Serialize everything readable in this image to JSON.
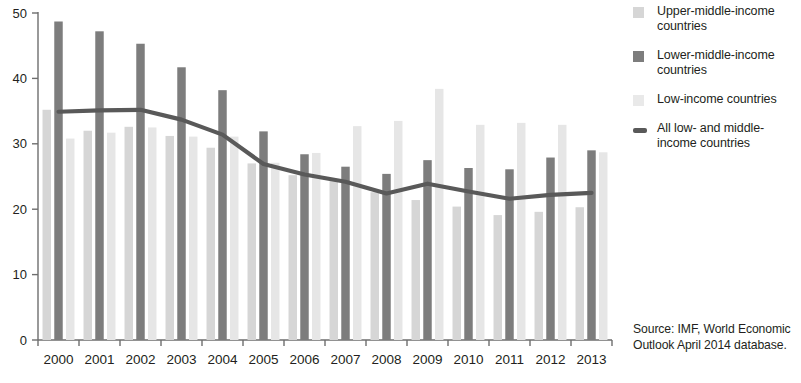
{
  "chart_data": {
    "type": "bar",
    "title": "",
    "subtitle": "",
    "xlabel": "",
    "ylabel": "",
    "ylim": [
      0,
      50
    ],
    "yticks": [
      0,
      10,
      20,
      30,
      40,
      50
    ],
    "grid": false,
    "legend_position": "right",
    "categories": [
      "2000",
      "2001",
      "2002",
      "2003",
      "2004",
      "2005",
      "2006",
      "2007",
      "2008",
      "2009",
      "2010",
      "2011",
      "2012",
      "2013"
    ],
    "series": [
      {
        "name": "Upper-middle-income countries",
        "type": "bar",
        "color": "#d6d6d6",
        "values": [
          35.2,
          32.0,
          32.6,
          31.2,
          29.4,
          27.0,
          25.2,
          24.3,
          22.6,
          21.4,
          20.4,
          19.1,
          19.6,
          20.3
        ]
      },
      {
        "name": "Lower-middle-income countries",
        "type": "bar",
        "color": "#7d7d7d",
        "values": [
          48.7,
          47.2,
          45.3,
          41.7,
          38.2,
          31.9,
          28.4,
          26.5,
          25.4,
          27.5,
          26.3,
          26.1,
          27.9,
          29.0
        ]
      },
      {
        "name": "Low-income countries",
        "type": "bar",
        "color": "#e6e6e6",
        "values": [
          30.8,
          31.7,
          32.5,
          31.1,
          31.1,
          27.1,
          28.6,
          32.7,
          33.5,
          38.4,
          32.9,
          33.2,
          32.9,
          28.7
        ]
      },
      {
        "name": "All low- and middle-income countries",
        "type": "line",
        "color": "#595959",
        "values": [
          34.9,
          35.1,
          35.2,
          33.7,
          31.4,
          26.9,
          25.3,
          24.2,
          22.4,
          23.9,
          22.7,
          21.6,
          22.2,
          22.5
        ]
      }
    ]
  },
  "legend": {
    "items": [
      {
        "label": "Upper-middle-income countries",
        "marker": "swatch",
        "color": "#d6d6d6"
      },
      {
        "label": "Lower-middle-income countries",
        "marker": "swatch",
        "color": "#7d7d7d"
      },
      {
        "label": "Low-income countries",
        "marker": "swatch",
        "color": "#e9e9e9"
      },
      {
        "label": "All low- and middle-income countries",
        "marker": "line",
        "color": "#595959"
      }
    ]
  },
  "source": {
    "line1": "Source:  IMF, World Economic",
    "line2": "Outlook April 2014 database."
  },
  "axes": {
    "y_tick_labels": [
      "0",
      "10",
      "20",
      "30",
      "40",
      "50"
    ],
    "x_tick_labels": [
      "2000",
      "2001",
      "2002",
      "2003",
      "2004",
      "2005",
      "2006",
      "2007",
      "2008",
      "2009",
      "2010",
      "2011",
      "2012",
      "2013"
    ]
  }
}
